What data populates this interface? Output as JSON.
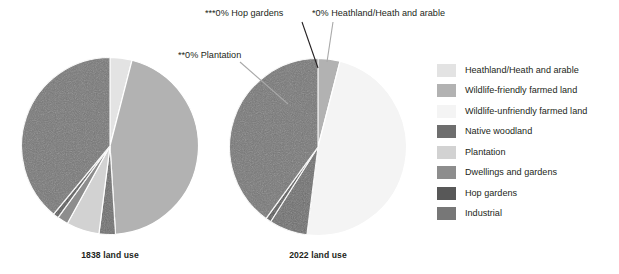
{
  "figure": {
    "background": "#ffffff"
  },
  "callouts": [
    {
      "id": "hop",
      "text": "***0% Hop gardens"
    },
    {
      "id": "heath",
      "text": "*0% Heathland/Heath and arable"
    },
    {
      "id": "plant",
      "text": "**0% Plantation"
    }
  ],
  "legend": {
    "position": "right",
    "items": [
      {
        "label": "Heathland/Heath and arable",
        "color": "#e3e3e3"
      },
      {
        "label": "Wildlife-friendly farmed land",
        "color": "#b2b2b2"
      },
      {
        "label": "Wildlife-unfriendly farmed land",
        "color": "#f4f4f4"
      },
      {
        "label": "Native woodland",
        "color": "#6e6e6e"
      },
      {
        "label": "Plantation",
        "color": "#d2d2d2"
      },
      {
        "label": "Dwellings and gardens",
        "color": "#8d8d8d"
      },
      {
        "label": "Hop gardens",
        "color": "#585858"
      },
      {
        "label": "Industrial",
        "color": "#777777"
      }
    ]
  },
  "chart_data": [
    {
      "type": "pie",
      "title": "1838 land use",
      "categories": [
        "Heathland/Heath and arable",
        "Wildlife-friendly farmed land",
        "Wildlife-unfriendly farmed land",
        "Native woodland",
        "Plantation",
        "Dwellings and gardens",
        "Hop gardens",
        "Industrial"
      ],
      "values": [
        4,
        45,
        0,
        3,
        6,
        2,
        1,
        39
      ],
      "colors": [
        "#e3e3e3",
        "#b2b2b2",
        "#f4f4f4",
        "#6e6e6e",
        "#d2d2d2",
        "#8d8d8d",
        "#585858",
        "#777777"
      ],
      "start_angle_deg": 0,
      "direction": "clockwise",
      "legend": "shared"
    },
    {
      "type": "pie",
      "title": "2022 land use",
      "categories": [
        "Heathland/Heath and arable",
        "Wildlife-friendly farmed land",
        "Wildlife-unfriendly farmed land",
        "Native woodland",
        "Plantation",
        "Dwellings and gardens",
        "Hop gardens",
        "Industrial"
      ],
      "values": [
        0,
        4,
        48,
        7,
        0,
        0,
        1,
        40
      ],
      "colors": [
        "#e3e3e3",
        "#b2b2b2",
        "#f4f4f4",
        "#6e6e6e",
        "#d2d2d2",
        "#8d8d8d",
        "#585858",
        "#777777"
      ],
      "start_angle_deg": 0,
      "direction": "clockwise",
      "legend": "shared"
    }
  ]
}
